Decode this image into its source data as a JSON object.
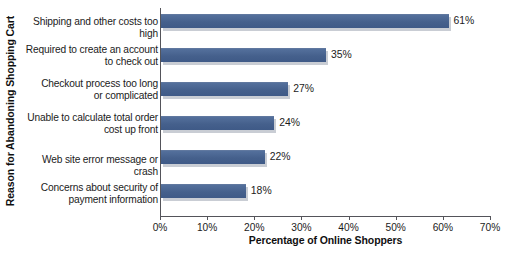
{
  "chart_data": {
    "type": "bar",
    "orientation": "horizontal",
    "title": "",
    "xlabel": "Percentage of Online Shoppers",
    "ylabel": "Reason for Abandoning Shopping Cart",
    "xlim": [
      0,
      70
    ],
    "grid": false,
    "legend": null,
    "xticks": [
      "0%",
      "10%",
      "20%",
      "30%",
      "40%",
      "50%",
      "60%",
      "70%"
    ],
    "xtick_values": [
      0,
      10,
      20,
      30,
      40,
      50,
      60,
      70
    ],
    "categories": [
      "Shipping and other costs too high",
      "Required to create an account to check out",
      "Checkout process too long or complicated",
      "Unable to calculate total order cost up front",
      "Web site error message or crash",
      "Concerns about security of payment information"
    ],
    "category_lines": [
      [
        "Shipping and other costs too high"
      ],
      [
        "Required to create an account",
        "to check out"
      ],
      [
        "Checkout process too long",
        "or complicated"
      ],
      [
        "Unable to calculate total order",
        "cost up front"
      ],
      [
        "Web site error message or crash"
      ],
      [
        "Concerns about security of",
        "payment information"
      ]
    ],
    "values": [
      61,
      35,
      27,
      24,
      22,
      18
    ],
    "value_labels": [
      "61%",
      "35%",
      "27%",
      "24%",
      "22%",
      "18%"
    ],
    "bar_color": "#4a6694",
    "bar_shadow_color": "#c9cdd4",
    "axis_color": "#54545a",
    "background_color": "#ffffff"
  }
}
